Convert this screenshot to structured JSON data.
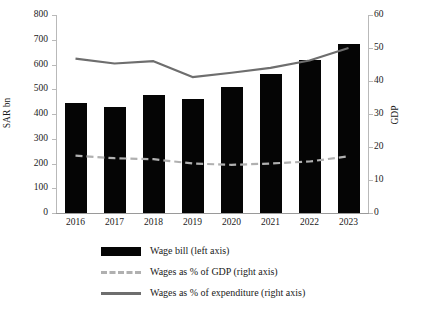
{
  "chart_data": {
    "type": "bar",
    "title": "",
    "subtitle": "",
    "xlabel": "",
    "ylabel": "SAR bn",
    "y2label": "GDP",
    "categories": [
      "2016",
      "2017",
      "2018",
      "2019",
      "2020",
      "2021",
      "2022",
      "2023"
    ],
    "ylim": [
      0,
      800
    ],
    "y2lim": [
      0,
      60
    ],
    "yticks": [
      "0",
      "100",
      "200",
      "300",
      "400",
      "500",
      "600",
      "700",
      "800"
    ],
    "y2ticks": [
      "0",
      "10",
      "20",
      "30",
      "40",
      "50",
      "60"
    ],
    "grid": false,
    "legend_position": "bottom",
    "series": [
      {
        "name": "Wage bill (left axis)",
        "kind": "bar",
        "axis": "left",
        "color": "#050505",
        "values": [
          444,
          428,
          478,
          460,
          508,
          562,
          618,
          682
        ]
      },
      {
        "name": "Wages as % of GDP (right axis)",
        "kind": "dashed-line",
        "axis": "right",
        "color": "#b0b0b0",
        "values": [
          17.4,
          16.6,
          16.3,
          15.0,
          14.6,
          15.0,
          15.6,
          17.2
        ]
      },
      {
        "name": "Wages as % of expenditure (right axis)",
        "kind": "line",
        "axis": "right",
        "color": "#6e6e6e",
        "values": [
          46.8,
          45.3,
          46.0,
          41.2,
          42.5,
          44.0,
          46.2,
          50.0
        ]
      }
    ]
  },
  "axes": {
    "left_title": "SAR bn",
    "right_title": "GDP"
  },
  "legend": {
    "items": [
      {
        "label": "Wage bill (left axis)",
        "swatch": "solid-bar-swatch"
      },
      {
        "label": "Wages as % of GDP (right axis)",
        "swatch": "dashed-line-swatch"
      },
      {
        "label": "Wages as % of expenditure (right axis)",
        "swatch": "solid-line-swatch"
      }
    ]
  }
}
